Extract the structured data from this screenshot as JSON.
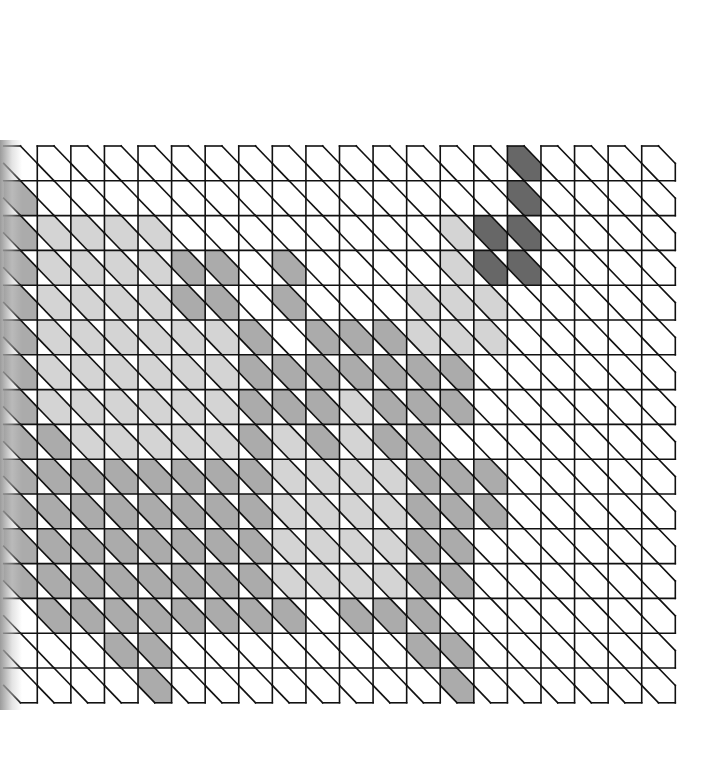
{
  "board": {
    "title": "Diagonal hex-band pixel puzzle grid",
    "rows": 16,
    "cols": 20,
    "origin_x": 3.7,
    "origin_y": 146,
    "cell_w": 33.58,
    "cell_h": 34.8,
    "legend": {
      ".": "empty",
      "l": "light",
      "m": "medium",
      "d": "dark"
    },
    "colors": {
      "l": "#d4d4d4",
      "m": "#ababab",
      "d": "#676767",
      "line": "#111111",
      "background": "#ffffff"
    },
    "grid": [
      "...............d....",
      "m..............d....",
      "mllll........ldd....",
      "mllllmm.m....ldd....",
      "mllllmm.m...lll.....",
      "mllllllm.mmmlll.....",
      "mllllllmmmmmmm......",
      "mllllllmmmlmmm......",
      "mmlllllmlmlmm.......",
      "mmmmmmmmllllmmm.....",
      "mmmmmmmmllllmmm.....",
      "mmmmmmmmllllmm......",
      "mmmmmmmmllllmm......",
      ".mmmmmmmm.mmm.......",
      "...mm.......mm......",
      "....m........m......"
    ]
  }
}
